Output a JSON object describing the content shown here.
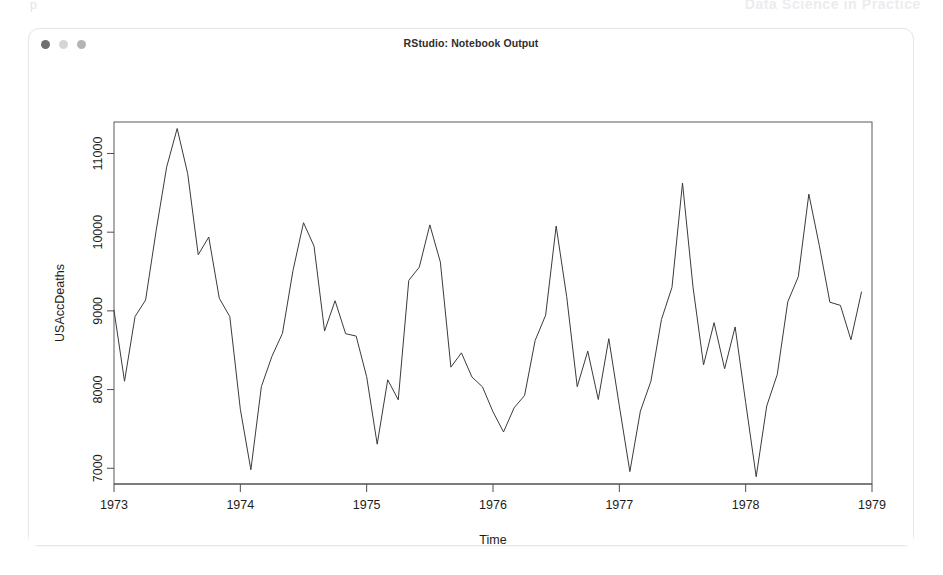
{
  "page_header": {
    "left_text": "p",
    "right_text": "Data Science in Practice"
  },
  "window": {
    "title": "RStudio: Notebook Output",
    "traffic_lights": [
      {
        "name": "close-button",
        "color": "#6f6f6f"
      },
      {
        "name": "minimize-button",
        "color": "#d5d5d5"
      },
      {
        "name": "zoom-button",
        "color": "#b4b4b4"
      }
    ]
  },
  "chart_data": {
    "type": "line",
    "title": "",
    "xlabel": "Time",
    "ylabel": "USAccDeaths",
    "xlim": [
      1973.0,
      1979.0
    ],
    "ylim": [
      6800,
      11400
    ],
    "xticks": [
      1973,
      1974,
      1975,
      1976,
      1977,
      1978,
      1979
    ],
    "xtick_labels": [
      "1973",
      "1974",
      "1975",
      "1976",
      "1977",
      "1978",
      "1979"
    ],
    "yticks": [
      7000,
      8000,
      9000,
      10000,
      11000
    ],
    "ytick_labels": [
      "7000",
      "8000",
      "9000",
      "10000",
      "11000"
    ],
    "grid": false,
    "legend": false,
    "line_color": "#3b3b3b",
    "series": [
      {
        "name": "USAccDeaths",
        "x": [
          1973.0,
          1973.0833,
          1973.1667,
          1973.25,
          1973.3333,
          1973.4167,
          1973.5,
          1973.5833,
          1973.6667,
          1973.75,
          1973.8333,
          1973.9167,
          1974.0,
          1974.0833,
          1974.1667,
          1974.25,
          1974.3333,
          1974.4167,
          1974.5,
          1974.5833,
          1974.6667,
          1974.75,
          1974.8333,
          1974.9167,
          1975.0,
          1975.0833,
          1975.1667,
          1975.25,
          1975.3333,
          1975.4167,
          1975.5,
          1975.5833,
          1975.6667,
          1975.75,
          1975.8333,
          1975.9167,
          1976.0,
          1976.0833,
          1976.1667,
          1976.25,
          1976.3333,
          1976.4167,
          1976.5,
          1976.5833,
          1976.6667,
          1976.75,
          1976.8333,
          1976.9167,
          1977.0,
          1977.0833,
          1977.1667,
          1977.25,
          1977.3333,
          1977.4167,
          1977.5,
          1977.5833,
          1977.6667,
          1977.75,
          1977.8333,
          1977.9167,
          1978.0,
          1978.0833,
          1978.1667,
          1978.25,
          1978.3333,
          1978.4167,
          1978.5,
          1978.5833,
          1978.6667,
          1978.75,
          1978.8333,
          1978.9167
        ],
        "values": [
          9007,
          8106,
          8928,
          9137,
          10017,
          10826,
          11317,
          10744,
          9713,
          9938,
          9161,
          8927,
          7750,
          6981,
          8038,
          8422,
          8714,
          9512,
          10120,
          9823,
          8743,
          9129,
          8710,
          8680,
          8162,
          7306,
          8124,
          7870,
          9387,
          9556,
          10093,
          9620,
          8285,
          8466,
          8160,
          8034,
          7717,
          7461,
          7767,
          7925,
          8623,
          8945,
          10078,
          9179,
          8037,
          8488,
          7874,
          8647,
          7792,
          6957,
          7726,
          8106,
          8890,
          9299,
          10625,
          9302,
          8314,
          8850,
          8265,
          8796,
          7836,
          6892,
          7791,
          8192,
          9115,
          9434,
          10484,
          9827,
          9110,
          9070,
          8633,
          9240
        ]
      }
    ]
  }
}
